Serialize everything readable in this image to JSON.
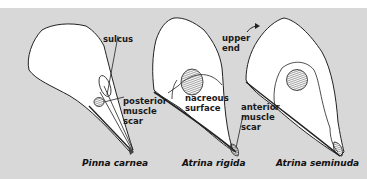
{
  "figure": {
    "background_color": "#d8d8d8",
    "specimens": [
      {
        "name": "Pinna carnea",
        "caption": "Pinna carnea"
      },
      {
        "name": "Atrina rigida",
        "caption": "Atrina rigida"
      },
      {
        "name": "Atrina seminuda",
        "caption": "Atrina seminuda"
      }
    ],
    "labels": {
      "sulcus": "sulcus",
      "posterior_muscle_scar": "posterior\nmuscle\nscar",
      "nacreous_surface": "nacreous\nsurface",
      "upper_end": "upper\nend",
      "anterior_muscle_scar": "anterior\nmuscle\nscar"
    }
  }
}
